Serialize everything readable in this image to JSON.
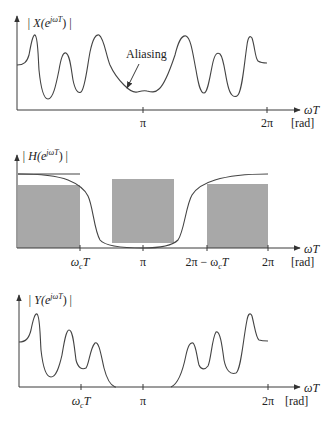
{
  "panels": {
    "input_spectrum": {
      "y_label_prefix": "| X(e",
      "y_label_exp": "jωT",
      "y_label_suffix": ") |",
      "annotation": "Aliasing",
      "x_label": "ωT",
      "x_unit": "[rad]",
      "ticks": [
        "π",
        "2π"
      ]
    },
    "filter_response": {
      "y_label_prefix": "| H(e",
      "y_label_exp": "jωT",
      "y_label_suffix": ") |",
      "x_label": "ωT",
      "x_unit": "[rad]",
      "tick_wc": "ω",
      "tick_wc_sub": "c",
      "tick_wc_T": "T",
      "tick_pi": "π",
      "tick_2pi_minus_prefix": "2π − ω",
      "tick_2pi_minus_sub": "c",
      "tick_2pi_minus_T": "T",
      "tick_2pi": "2π"
    },
    "output_spectrum": {
      "y_label_prefix": "| Y(e",
      "y_label_exp": "jωT",
      "y_label_suffix": ") |",
      "x_label": "ωT",
      "x_unit": "[rad]",
      "tick_wc": "ω",
      "tick_wc_sub": "c",
      "tick_wc_T": "T",
      "tick_pi": "π",
      "tick_2pi": "2π"
    }
  },
  "colors": {
    "axis": "#3a3a3a",
    "curve": "#444444",
    "shade": "#a8a8a8"
  }
}
